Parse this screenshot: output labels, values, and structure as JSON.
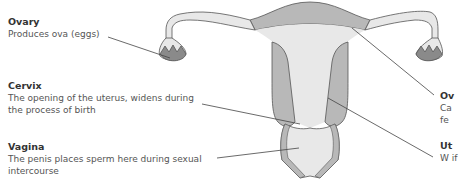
{
  "labels": {
    "ovary": {
      "title": "Ovary",
      "desc": "Produces ova (eggs)"
    },
    "cervix": {
      "title": "Cervix",
      "desc": "The opening of the uterus, widens during the process of birth"
    },
    "vagina": {
      "title": "Vagina",
      "desc": "The penis places sperm here during sexual intercourse"
    },
    "oviduct": {
      "title": "Ov",
      "desc": "Ca fe"
    },
    "uterus": {
      "title": "Ut",
      "desc": "W if"
    }
  },
  "colors": {
    "outline": "#555555",
    "tissue_dark": "#b8b8b8",
    "tissue_light": "#e8e8e8",
    "ovary_fill": "#8a8a8a",
    "leader_line": "#444444",
    "title_text": "#333333",
    "body_text": "#555555"
  }
}
